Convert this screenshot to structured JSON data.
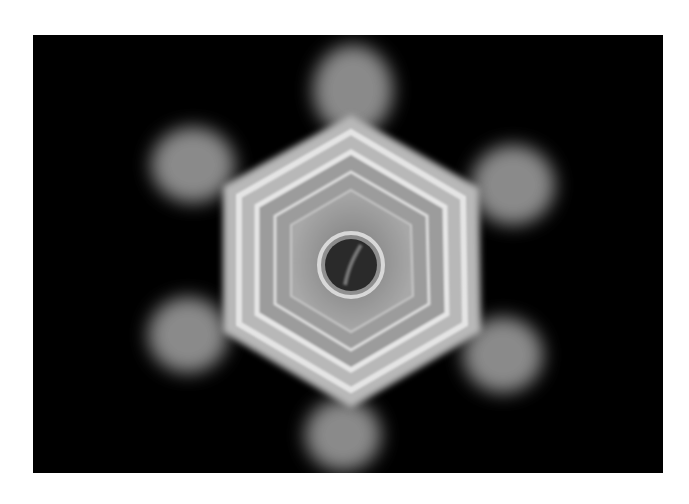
{
  "image": {
    "subject": "hexagonal ice crystal on black background",
    "background_color": "#000000",
    "page_background": "#ffffff",
    "crystal_color": "#d8d8d8",
    "arm_color": "#8a8a8a"
  }
}
